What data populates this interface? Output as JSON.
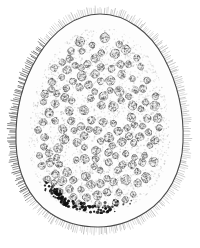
{
  "figure": {
    "medium": "ink stipple and line engraving",
    "background_color": "#ffffff",
    "canvas": {
      "width": 200,
      "height": 248
    }
  },
  "palette": {
    "outline": "#4a4a4a",
    "cilia": "#6e6e6e",
    "cilia_dark": "#545454",
    "cytoplasm_fill": "#fdfdfd",
    "stipple": "#b9b9b9",
    "cell_ring": "#707070",
    "cell_ring_dark": "#4f4f4f",
    "cell_fill": "#f2f2f2",
    "granule": "#101010",
    "margin_zone": "#fcfcfc"
  },
  "body_outline": {
    "name": "ovoid-body-contour",
    "description": "egg shaped contour, narrow rounded apex at top, broad rounded base at bottom",
    "path": "M 100 14 C 126 14 150 32 164 58 C 178 84 184 114 183 142 C 182 172 168 198 146 212 C 126 225 110 227 98 227 C 84 227 66 224 50 213 C 29 199 17 173 16 143 C 15 113 22 82 38 56 C 53 31 76 14 100 14 Z",
    "stroke_width": 1.1
  },
  "inner_margin": {
    "name": "acellular-marginal-zone",
    "description": "clear cell-free band just inside the body wall",
    "inset": 13
  },
  "cilia": {
    "name": "ciliated-border",
    "description": "dense radial hair-like cilia projecting outward from the entire body wall",
    "count": 300,
    "length_min": 5,
    "length_max": 9,
    "stroke_width": 0.55,
    "left_band_darker": true
  },
  "cytoplasm": {
    "name": "granular-cytoplasm",
    "description": "fine reticulated granular ground substance filling the body cavity",
    "stipple_count": 2600,
    "stipple_radius": 0.55
  },
  "cells": {
    "name": "oocyte-cell-population",
    "description": "scattered rounded cells with dark irregular rings and pale centers",
    "count": 150,
    "radius_min": 3.0,
    "radius_max": 5.2,
    "ring_segments": 11
  },
  "granule_cluster": {
    "name": "pigment-granule-cluster",
    "description": "compact band of opaque black granules in the lower left quadrant",
    "count": 120,
    "radius_min": 0.9,
    "radius_max": 1.8,
    "band_path_points": [
      [
        44,
        186
      ],
      [
        52,
        190
      ],
      [
        58,
        196
      ],
      [
        64,
        201
      ],
      [
        72,
        204
      ],
      [
        82,
        207
      ],
      [
        92,
        209
      ],
      [
        101,
        210
      ],
      [
        110,
        209
      ]
    ],
    "band_thickness": 8
  },
  "labels": {
    "alt_text": "Ink drawing of an ovoid ciliated organism in cross-section. A continuous fringe of fine cilia surrounds the egg-shaped body wall. The interior is filled with finely granular cytoplasm containing about one hundred fifty scattered rounded cells. A dense band of black pigment granules lies in the lower left region.",
    "figure_caption": ""
  }
}
